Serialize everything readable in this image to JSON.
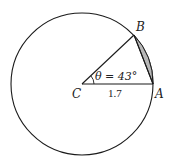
{
  "diagram": {
    "type": "circle-sector-segment",
    "points": {
      "center": {
        "label": "C"
      },
      "a": {
        "label": "A"
      },
      "b": {
        "label": "B"
      }
    },
    "angle_label": "θ = 43°",
    "radius_label": "1.7",
    "colors": {
      "stroke": "#1a1a1a",
      "segment_fill": "#b8b8b8",
      "background": "#ffffff"
    }
  }
}
